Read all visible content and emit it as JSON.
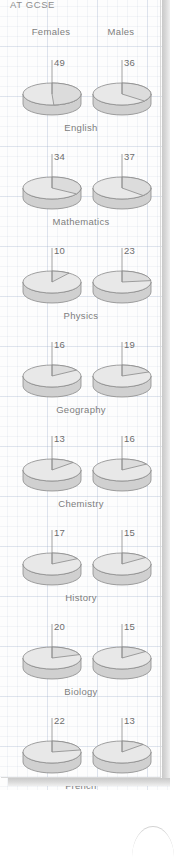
{
  "page": {
    "title": "AT GCSE",
    "column_headers": [
      "Females",
      "Males"
    ]
  },
  "chart_data": {
    "type": "pie",
    "title": "AT GCSE",
    "subtitle": "",
    "xlabel": "",
    "ylabel": "",
    "legend_position": "top",
    "style": "3d-pie-pair-per-subject",
    "series_names": [
      "Females",
      "Males"
    ],
    "categories": [
      "English",
      "Mathematics",
      "Physics",
      "Geography",
      "Chemistry",
      "History",
      "Biology",
      "French"
    ],
    "units": "percent",
    "series": [
      {
        "name": "Females",
        "values": [
          49,
          34,
          10,
          16,
          13,
          17,
          20,
          22
        ]
      },
      {
        "name": "Males",
        "values": [
          36,
          37,
          23,
          19,
          16,
          15,
          15,
          13
        ]
      }
    ],
    "rows": [
      {
        "subject": "English",
        "females": 49,
        "males": 36
      },
      {
        "subject": "Mathematics",
        "females": 34,
        "males": 37
      },
      {
        "subject": "Physics",
        "females": 10,
        "males": 23
      },
      {
        "subject": "Geography",
        "females": 16,
        "males": 19
      },
      {
        "subject": "Chemistry",
        "females": 13,
        "males": 16
      },
      {
        "subject": "History",
        "females": 17,
        "males": 15
      },
      {
        "subject": "Biology",
        "females": 20,
        "males": 15
      },
      {
        "subject": "French",
        "females": 22,
        "males": 13
      }
    ],
    "colors": {
      "pie_top": "#e8e8e8",
      "pie_slice": "#dcdcdc",
      "pie_side": "#d0d0d0",
      "outline": "#8a8a8a",
      "grid": "#96aac8",
      "text": "#7d7d7d",
      "paper": "#fdfdfd",
      "shadow": "#c9c9c9"
    }
  }
}
